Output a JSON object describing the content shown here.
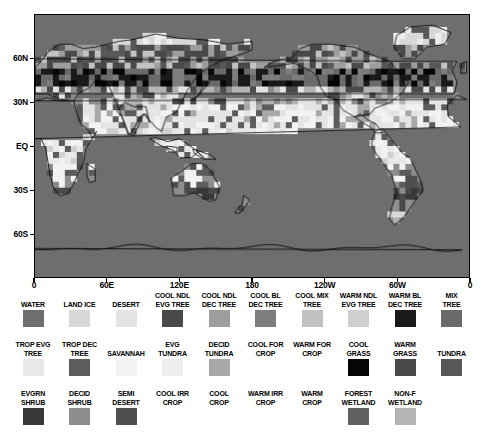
{
  "figure": {
    "kind": "global-land-cover-map",
    "projection": "equirectangular",
    "map_background_color": "#6e6e6e"
  },
  "axes": {
    "x_ticks": [
      "0",
      "60E",
      "120E",
      "180",
      "120W",
      "60W",
      "0"
    ],
    "x_positions_deg": [
      0,
      60,
      120,
      180,
      240,
      300,
      360
    ],
    "y_ticks": [
      "60N",
      "30N",
      "EQ",
      "30S",
      "60S"
    ],
    "y_positions_deg": [
      60,
      30,
      0,
      -30,
      -60
    ],
    "lon_range": [
      0,
      360
    ],
    "lat_range": [
      -90,
      90
    ]
  },
  "chart_data": {
    "type": "heatmap",
    "title": "",
    "xlabel": "",
    "ylabel": "",
    "xlim": [
      0,
      360
    ],
    "ylim": [
      -90,
      90
    ],
    "grid": false,
    "colormap": "grayscale",
    "categories": [
      "WATER",
      "LAND ICE",
      "DESERT",
      "COOL NDL EVG TREE",
      "COOL NDL DEC TREE",
      "COOL BL DEC TREE",
      "COOL MIX TREE",
      "WARM NDL EVG TREE",
      "WARM BL DEC TREE",
      "MIX TREE",
      "TROP EVG TREE",
      "TROP DEC TREE",
      "SAVANNAH",
      "EVG TUNDRA",
      "DECID TUNDRA",
      "COOL FOR CROP",
      "WARM FOR CROP",
      "COOL GRASS",
      "WARM GRASS",
      "TUNDRA",
      "EVGRN SHRUB",
      "DECID SHRUB",
      "SEMI DESERT",
      "COOL IRR CROP",
      "COOL CROP",
      "WARM IRR CROP",
      "WARM CROP",
      "FOREST WETLAND",
      "NON-F WETLAND"
    ],
    "values": [
      "#6e6e6e",
      "#d8d8d8",
      "#e4e4e4",
      "#494949",
      "#9d9d9d",
      "#7d7d7d",
      "#c2c2c2",
      "#d0d0d0",
      "#1a1a1a",
      "#6a6a6a",
      "#e8e8e8",
      "#5c5c5c",
      "#f2f2f2",
      "#eeeeee",
      "#a8a8a8",
      "#ffffff",
      "#ffffff",
      "#050505",
      "#4a4a4a",
      "#585858",
      "#383838",
      "#8d8d8d",
      "#4f4f4f",
      "#ffffff",
      "#ffffff",
      "#ffffff",
      "#ffffff",
      "#606060",
      "#b4b4b4"
    ]
  },
  "legend": {
    "rows": [
      {
        "row_index": 0,
        "items": [
          {
            "label": "WATER",
            "color": "#6e6e6e",
            "has_swatch": true
          },
          {
            "label": "LAND ICE",
            "color": "#d8d8d8",
            "has_swatch": true
          },
          {
            "label": "DESERT",
            "color": "#e4e4e4",
            "has_swatch": true
          },
          {
            "label": "COOL NDL\nEVG TREE",
            "color": "#494949",
            "has_swatch": true
          },
          {
            "label": "COOL NDL\nDEC TREE",
            "color": "#9d9d9d",
            "has_swatch": true
          },
          {
            "label": "COOL BL\nDEC TREE",
            "color": "#7d7d7d",
            "has_swatch": true
          },
          {
            "label": "COOL MIX\nTREE",
            "color": "#c2c2c2",
            "has_swatch": true
          },
          {
            "label": "WARM NDL\nEVG TREE",
            "color": "#d0d0d0",
            "has_swatch": true
          },
          {
            "label": "WARM BL\nDEC TREE",
            "color": "#1a1a1a",
            "has_swatch": true
          },
          {
            "label": "MIX\nTREE",
            "color": "#6a6a6a",
            "has_swatch": true
          }
        ]
      },
      {
        "row_index": 1,
        "items": [
          {
            "label": "TROP EVG\nTREE",
            "color": "#e8e8e8",
            "has_swatch": true
          },
          {
            "label": "TROP DEC\nTREE",
            "color": "#5c5c5c",
            "has_swatch": true
          },
          {
            "label": "SAVANNAH",
            "color": "#f2f2f2",
            "has_swatch": true
          },
          {
            "label": "EVG\nTUNDRA",
            "color": "#eeeeee",
            "has_swatch": true
          },
          {
            "label": "DECID\nTUNDRA",
            "color": "#a8a8a8",
            "has_swatch": true
          },
          {
            "label": "COOL FOR\nCROP",
            "color": "#ffffff",
            "has_swatch": false
          },
          {
            "label": "WARM FOR\nCROP",
            "color": "#ffffff",
            "has_swatch": false
          },
          {
            "label": "COOL\nGRASS",
            "color": "#050505",
            "has_swatch": true
          },
          {
            "label": "WARM\nGRASS",
            "color": "#4a4a4a",
            "has_swatch": true
          },
          {
            "label": "TUNDRA",
            "color": "#585858",
            "has_swatch": true
          }
        ]
      },
      {
        "row_index": 2,
        "items": [
          {
            "label": "EVGRN\nSHRUB",
            "color": "#383838",
            "has_swatch": true
          },
          {
            "label": "DECID\nSHRUB",
            "color": "#8d8d8d",
            "has_swatch": true
          },
          {
            "label": "SEMI\nDESERT",
            "color": "#4f4f4f",
            "has_swatch": true
          },
          {
            "label": "COOL IRR\nCROP",
            "color": "#ffffff",
            "has_swatch": false
          },
          {
            "label": "COOL\nCROP",
            "color": "#ffffff",
            "has_swatch": false
          },
          {
            "label": "WARM IRR\nCROP",
            "color": "#ffffff",
            "has_swatch": false
          },
          {
            "label": "WARM\nCROP",
            "color": "#ffffff",
            "has_swatch": false
          },
          {
            "label": "FOREST\nWETLAND",
            "color": "#606060",
            "has_swatch": true
          },
          {
            "label": "NON-F\nWETLAND",
            "color": "#b4b4b4",
            "has_swatch": true
          },
          {
            "label": "",
            "color": "#ffffff",
            "has_swatch": false
          }
        ]
      }
    ]
  }
}
